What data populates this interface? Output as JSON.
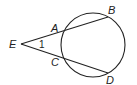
{
  "diagram": {
    "type": "circle with two secants from external point",
    "circle": {
      "cx": 93,
      "cy": 45,
      "r": 32
    },
    "points": {
      "E": {
        "label": "E",
        "x": 21,
        "y": 44
      },
      "A": {
        "label": "A",
        "x": 62,
        "y": 31
      },
      "B": {
        "label": "B",
        "x": 108,
        "y": 17
      },
      "C": {
        "label": "C",
        "x": 62,
        "y": 57
      },
      "D": {
        "label": "D",
        "x": 108,
        "y": 73
      }
    },
    "angle_label": "1",
    "colors": {
      "stroke": "#222222",
      "background": "#ffffff"
    }
  }
}
